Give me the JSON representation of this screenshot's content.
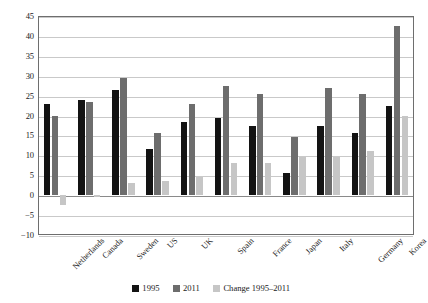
{
  "chart_data": {
    "type": "bar",
    "title": "",
    "subtitle": "",
    "xlabel": "",
    "ylabel": "",
    "ylim": [
      -10,
      45
    ],
    "yticks": [
      -10,
      -5,
      0,
      5,
      10,
      15,
      20,
      25,
      30,
      35,
      40,
      45
    ],
    "ytick_labels": [
      "−10",
      "−5",
      "0",
      "5",
      "10",
      "15",
      "20",
      "25",
      "30",
      "35",
      "40",
      "45"
    ],
    "grid": true,
    "legend_position": "bottom-center",
    "categories": [
      "Netherlands",
      "Canada",
      "Sweden",
      "US",
      "UK",
      "Spain",
      "France",
      "Japan",
      "Italy",
      "Germany",
      "Korea"
    ],
    "series": [
      {
        "name": "1995",
        "color": "#131313",
        "values": [
          23.0,
          24.0,
          26.5,
          11.5,
          18.5,
          19.5,
          17.5,
          5.5,
          17.5,
          15.5,
          22.5
        ]
      },
      {
        "name": "2011",
        "color": "#6d6d6d",
        "values": [
          20.0,
          23.5,
          29.5,
          15.5,
          23.0,
          27.5,
          25.5,
          14.5,
          27.0,
          25.5,
          42.5
        ]
      },
      {
        "name": "Change 1995–2011",
        "color": "#c6c6c6",
        "values": [
          -2.5,
          -0.5,
          3.0,
          3.5,
          4.5,
          8.0,
          8.0,
          9.5,
          9.5,
          11.0,
          20.0
        ]
      }
    ]
  },
  "axes": {
    "y_axis_name": "y-axis",
    "x_axis_name": "x-axis"
  }
}
